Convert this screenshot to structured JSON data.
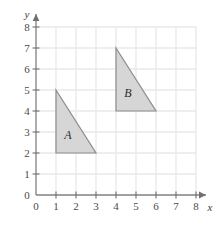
{
  "figure": {
    "background_color": "#ffffff",
    "grid_color": "#e9e9e9",
    "axis_color": "#808080",
    "tick_color": "#707070",
    "label_color": "#4a4a4a"
  },
  "axes": {
    "x": {
      "name": "x",
      "min": 0,
      "max": 8,
      "ticks": [
        0,
        1,
        2,
        3,
        4,
        5,
        6,
        7,
        8
      ],
      "tick_labels": [
        "0",
        "1",
        "2",
        "3",
        "4",
        "5",
        "6",
        "7",
        "8"
      ],
      "has_arrow": true
    },
    "y": {
      "name": "y",
      "min": 0,
      "max": 8,
      "ticks": [
        0,
        1,
        2,
        3,
        4,
        5,
        6,
        7,
        8
      ],
      "tick_labels": [
        "0",
        "1",
        "2",
        "3",
        "4",
        "5",
        "6",
        "7",
        "8"
      ],
      "has_arrow": true
    }
  },
  "chart_data": {
    "type": "scatter",
    "title": "",
    "xlabel": "x",
    "ylabel": "y",
    "xlim": [
      0,
      8
    ],
    "ylim": [
      0,
      8
    ],
    "grid": true,
    "legend": "none",
    "shapes": [
      {
        "label": "A",
        "type": "right-triangle",
        "vertices": [
          [
            1,
            5
          ],
          [
            1,
            2
          ],
          [
            3,
            2
          ]
        ],
        "label_position": [
          1.6,
          2.85
        ],
        "fill": "#d6d6d6",
        "stroke": "#8c8c8c"
      },
      {
        "label": "B",
        "type": "right-triangle",
        "vertices": [
          [
            4,
            7
          ],
          [
            4,
            4
          ],
          [
            6,
            4
          ]
        ],
        "label_position": [
          4.6,
          4.85
        ],
        "fill": "#d6d6d6",
        "stroke": "#8c8c8c"
      }
    ]
  }
}
